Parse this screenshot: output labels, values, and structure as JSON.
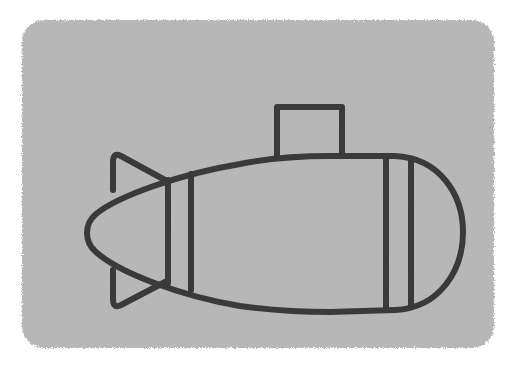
{
  "illustration": {
    "subject": "submarine",
    "colors": {
      "background": "#ffffff",
      "card": "#b4b4b4",
      "stroke": "#3a3a3a"
    },
    "stroke_width": 6
  }
}
